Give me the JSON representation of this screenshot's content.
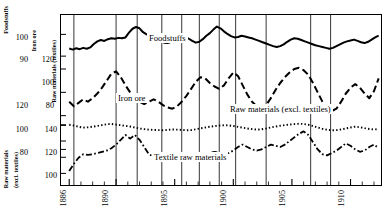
{
  "chart_data": {
    "type": "line",
    "title": "",
    "xlabel": "",
    "ylabel": "",
    "xlim": [
      1885.3,
      1912.6
    ],
    "grid": false,
    "legend_position": "inline-annotations",
    "x_ticks_major": [
      1886,
      1890,
      1895,
      1900,
      1905,
      1910
    ],
    "x_tick_labels": [
      "1886",
      "1890",
      "1895",
      "1900",
      "1905",
      "1910"
    ],
    "x_ticks_minor": [
      1887,
      1888,
      1889,
      1891,
      1892,
      1893,
      1894,
      1896,
      1897,
      1898,
      1899,
      1901,
      1902,
      1903,
      1904,
      1906,
      1907,
      1908,
      1909,
      1911,
      1912
    ],
    "reference_lines": [
      1886.4,
      1890.0,
      1891.8,
      1893.9,
      1895.6,
      1897.1,
      1898.8,
      1900.2,
      1902.8,
      1906.6,
      1908.3
    ],
    "axes": [
      {
        "name": "Foodstuffs",
        "label": "Foodstuffs",
        "ticks": [
          100,
          90
        ],
        "ylim": [
          85,
          108
        ],
        "style": "solid"
      },
      {
        "name": "Iron ore",
        "label": "Iron ore",
        "ticks": [
          120,
          100,
          80
        ],
        "ylim": [
          72,
          132
        ],
        "style": "dashed"
      },
      {
        "name": "Raw materials (textiles)",
        "label": "Raw materials (textiles)",
        "ticks": [
          140,
          120,
          100
        ],
        "ylim": [
          88,
          152
        ],
        "style": "dotted"
      },
      {
        "name": "Raw materials (excl. textiles)",
        "label": "Raw materials (excl. textiles)",
        "ticks": [
          120,
          100,
          80
        ],
        "ylim": [
          72,
          132
        ],
        "style": "dashdot"
      }
    ],
    "series": [
      {
        "name": "Foodstuffs",
        "label": "Foodstuffs",
        "style": "solid",
        "axis": "Foodstuffs",
        "x": [
          1886.0,
          1886.3,
          1886.6,
          1886.9,
          1887.2,
          1887.5,
          1887.8,
          1888.1,
          1888.4,
          1888.7,
          1889.0,
          1889.3,
          1889.6,
          1889.9,
          1890.2,
          1890.5,
          1890.8,
          1891.1,
          1891.4,
          1891.7,
          1892.0,
          1892.3,
          1892.6,
          1892.9,
          1893.2,
          1893.5,
          1893.8,
          1894.1,
          1894.4,
          1894.7,
          1895.0,
          1895.3,
          1895.6,
          1895.9,
          1896.2,
          1896.5,
          1896.8,
          1897.1,
          1897.4,
          1897.7,
          1898.0,
          1898.3,
          1898.6,
          1898.9,
          1899.2,
          1899.5,
          1899.8,
          1900.1,
          1900.4,
          1900.7,
          1901.0,
          1901.3,
          1901.6,
          1901.9,
          1902.2,
          1902.5,
          1902.8,
          1903.1,
          1903.4,
          1903.7,
          1904.0,
          1904.3,
          1904.6,
          1904.9,
          1905.2,
          1905.5,
          1905.8,
          1906.1,
          1906.4,
          1906.7,
          1907.0,
          1907.3,
          1907.6,
          1907.9,
          1908.2,
          1908.5,
          1908.8,
          1909.1,
          1909.4,
          1909.7,
          1910.0,
          1910.3,
          1910.6,
          1910.9,
          1911.2,
          1911.5,
          1911.8,
          1912.1,
          1912.4
        ],
        "y": [
          93.5,
          93.0,
          93.6,
          93.2,
          93.8,
          93.4,
          94.0,
          95.6,
          96.8,
          97.4,
          97.0,
          97.8,
          98.2,
          98.0,
          98.4,
          98.2,
          98.6,
          100.8,
          102.6,
          103.4,
          102.8,
          101.0,
          100.0,
          99.2,
          98.4,
          97.6,
          96.8,
          96.2,
          96.0,
          96.6,
          97.4,
          98.6,
          99.6,
          99.0,
          98.0,
          97.0,
          96.2,
          96.6,
          97.8,
          99.4,
          100.6,
          102.2,
          103.6,
          102.8,
          101.4,
          100.2,
          99.2,
          98.6,
          98.8,
          99.4,
          99.0,
          98.6,
          98.2,
          97.6,
          97.0,
          96.4,
          95.8,
          95.2,
          94.6,
          94.2,
          94.6,
          95.4,
          96.6,
          97.6,
          98.2,
          98.0,
          97.4,
          96.8,
          96.2,
          95.6,
          95.0,
          94.6,
          94.2,
          93.8,
          93.4,
          93.8,
          94.6,
          95.4,
          96.2,
          96.8,
          97.2,
          97.6,
          97.0,
          96.4,
          96.0,
          96.6,
          97.6,
          98.6,
          99.4
        ]
      },
      {
        "name": "Iron ore",
        "label": "Iron ore",
        "style": "dashed",
        "axis": "Iron ore",
        "x": [
          1886.0,
          1886.4,
          1886.8,
          1887.2,
          1887.6,
          1888.0,
          1888.4,
          1888.8,
          1889.2,
          1889.6,
          1890.0,
          1890.4,
          1890.8,
          1891.2,
          1891.6,
          1892.0,
          1892.4,
          1892.8,
          1893.2,
          1893.6,
          1894.0,
          1894.4,
          1894.8,
          1895.2,
          1895.6,
          1896.0,
          1896.4,
          1896.8,
          1897.2,
          1897.6,
          1898.0,
          1898.4,
          1898.8,
          1899.2,
          1899.6,
          1900.0,
          1900.4,
          1900.8,
          1901.2,
          1901.6,
          1902.0,
          1902.4,
          1902.8,
          1903.2,
          1903.6,
          1904.0,
          1904.4,
          1904.8,
          1905.2,
          1905.6,
          1906.0,
          1906.4,
          1906.8,
          1907.2,
          1907.6,
          1908.0,
          1908.4,
          1908.8,
          1909.2,
          1909.6,
          1910.0,
          1910.4,
          1910.8,
          1911.2,
          1911.6,
          1912.0,
          1912.4
        ],
        "y": [
          92.0,
          88.0,
          91.0,
          94.0,
          92.0,
          95.0,
          99.0,
          104.0,
          110.0,
          116.0,
          118.0,
          113.0,
          106.0,
          100.0,
          95.0,
          92.0,
          90.0,
          92.0,
          94.0,
          92.0,
          89.0,
          87.0,
          86.0,
          88.0,
          92.0,
          97.0,
          103.0,
          109.0,
          113.0,
          112.0,
          108.0,
          105.0,
          103.0,
          106.0,
          112.0,
          117.0,
          114.0,
          106.0,
          98.0,
          92.0,
          88.0,
          86.0,
          89.0,
          95.0,
          102.0,
          108.0,
          113.0,
          117.0,
          120.0,
          121.0,
          119.0,
          115.0,
          108.0,
          100.0,
          92.0,
          86.0,
          84.0,
          86.0,
          92.0,
          99.0,
          104.0,
          107.0,
          104.0,
          99.0,
          95.0,
          101.0,
          112.0
        ]
      },
      {
        "name": "Raw materials (excl. textiles)",
        "label": "Raw materials (excl. textiles)",
        "style": "dotted",
        "axis": "Raw materials (textiles)",
        "x": [
          1886.0,
          1886.4,
          1886.8,
          1887.2,
          1887.6,
          1888.0,
          1888.4,
          1888.8,
          1889.2,
          1889.6,
          1890.0,
          1890.4,
          1890.8,
          1891.2,
          1891.6,
          1892.0,
          1892.4,
          1892.8,
          1893.2,
          1893.6,
          1894.0,
          1894.4,
          1894.8,
          1895.2,
          1895.6,
          1896.0,
          1896.4,
          1896.8,
          1897.2,
          1897.6,
          1898.0,
          1898.4,
          1898.8,
          1899.2,
          1899.6,
          1900.0,
          1900.4,
          1900.8,
          1901.2,
          1901.6,
          1902.0,
          1902.4,
          1902.8,
          1903.2,
          1903.6,
          1904.0,
          1904.4,
          1904.8,
          1905.2,
          1905.6,
          1906.0,
          1906.4,
          1906.8,
          1907.2,
          1907.6,
          1908.0,
          1908.4,
          1908.8,
          1909.2,
          1909.6,
          1910.0,
          1910.4,
          1910.8,
          1911.2,
          1911.6,
          1912.0,
          1912.4
        ],
        "y": [
          140.0,
          139.0,
          137.6,
          136.4,
          136.8,
          137.6,
          138.6,
          139.6,
          140.6,
          141.0,
          140.2,
          139.4,
          138.6,
          137.8,
          136.6,
          135.4,
          134.6,
          134.0,
          133.6,
          133.4,
          133.2,
          133.6,
          134.2,
          134.0,
          133.6,
          133.2,
          133.4,
          134.4,
          135.6,
          136.6,
          137.6,
          138.4,
          139.0,
          139.4,
          139.2,
          138.4,
          137.4,
          136.4,
          135.4,
          134.6,
          134.0,
          134.4,
          135.4,
          136.6,
          137.8,
          138.8,
          139.6,
          140.2,
          140.8,
          141.2,
          141.0,
          140.0,
          138.4,
          136.6,
          135.0,
          133.8,
          133.2,
          133.4,
          134.2,
          135.4,
          136.6,
          137.6,
          137.0,
          135.8,
          134.8,
          134.2,
          134.6
        ]
      },
      {
        "name": "Textile raw materials",
        "label": "Textile raw materials",
        "style": "dashdot",
        "axis": "Raw materials (excl. textiles)",
        "x": [
          1886.0,
          1886.4,
          1886.8,
          1887.2,
          1887.6,
          1888.0,
          1888.4,
          1888.8,
          1889.2,
          1889.6,
          1890.0,
          1890.4,
          1890.8,
          1891.2,
          1891.6,
          1892.0,
          1892.4,
          1892.8,
          1893.2,
          1893.6,
          1894.0,
          1894.4,
          1894.8,
          1895.2,
          1895.6,
          1896.0,
          1896.4,
          1896.8,
          1897.2,
          1897.6,
          1898.0,
          1898.4,
          1898.8,
          1899.2,
          1899.6,
          1900.0,
          1900.4,
          1900.8,
          1901.2,
          1901.6,
          1902.0,
          1902.4,
          1902.8,
          1903.2,
          1903.6,
          1904.0,
          1904.4,
          1904.8,
          1905.2,
          1905.6,
          1906.0,
          1906.4,
          1906.8,
          1907.2,
          1907.6,
          1908.0,
          1908.4,
          1908.8,
          1909.2,
          1909.6,
          1910.0,
          1910.4,
          1910.8,
          1911.2,
          1911.6,
          1912.0,
          1912.4
        ],
        "y": [
          82.0,
          88.0,
          93.0,
          96.0,
          95.5,
          96.0,
          97.0,
          98.0,
          99.0,
          101.0,
          104.0,
          108.0,
          112.0,
          109.0,
          112.0,
          108.0,
          102.0,
          96.0,
          94.0,
          93.0,
          91.0,
          90.5,
          92.0,
          94.0,
          92.0,
          90.5,
          91.0,
          93.0,
          95.0,
          96.0,
          97.0,
          98.0,
          97.0,
          96.0,
          97.0,
          99.0,
          102.0,
          104.0,
          102.0,
          100.0,
          99.0,
          100.0,
          102.0,
          104.0,
          103.0,
          102.0,
          104.0,
          107.0,
          110.0,
          113.0,
          115.0,
          112.0,
          106.0,
          100.0,
          96.0,
          95.0,
          97.0,
          99.0,
          102.0,
          105.0,
          103.0,
          100.0,
          98.0,
          99.0,
          102.0,
          104.0,
          101.0
        ]
      }
    ]
  },
  "annotations": {
    "foodstuffs": "Foodstuffs",
    "iron_ore": "Iron ore",
    "raw_excl_textiles": "Raw materials (excl. textiles)",
    "textile_raw": "Textile raw materials"
  },
  "axis_titles": {
    "foodstuffs": "Foodstuffs",
    "iron_ore": "Iron ore",
    "raw_textiles": "Raw materials (textiles)",
    "raw_excl_textiles": "Raw materials\n(excl. textiles)",
    "raw_excl_textiles_l1": "Raw materials",
    "raw_excl_textiles_l2": "(excl. textiles)"
  },
  "y_labels": {
    "foodstuffs": [
      "100",
      "90"
    ],
    "iron_ore": [
      "120",
      "100",
      "80"
    ],
    "raw_textiles": [
      "140",
      "120",
      "100"
    ],
    "raw_excl_textiles": [
      "120",
      "100",
      "80"
    ]
  },
  "x_labels": [
    "1886",
    "1890",
    "1895",
    "1900",
    "1905",
    "1910"
  ]
}
